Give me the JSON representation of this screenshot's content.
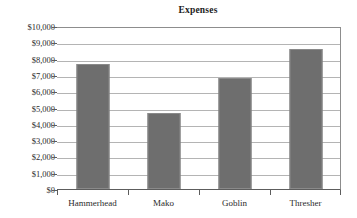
{
  "chart_data": {
    "type": "bar",
    "title": "Expenses",
    "xlabel": "",
    "ylabel": "",
    "categories": [
      "Hammerhead",
      "Mako",
      "Goblin",
      "Thresher"
    ],
    "values": [
      7650,
      4650,
      6800,
      8600
    ],
    "ylim": [
      0,
      10000
    ],
    "ytick_values": [
      0,
      1000,
      2000,
      3000,
      4000,
      5000,
      6000,
      7000,
      8000,
      9000,
      10000
    ],
    "ytick_labels": [
      "$10,000",
      "$9,000",
      "$8,000",
      "$7,000",
      "$6,000",
      "$5,000",
      "$4,000",
      "$3,000",
      "$2,000",
      "$1,000",
      "$0"
    ],
    "grid": true,
    "legend": false,
    "bar_color": "#6e6e6e",
    "gridline_color": "#b4b4b4",
    "axis_color": "#5d5d5d",
    "background_color": "#ffffff"
  }
}
